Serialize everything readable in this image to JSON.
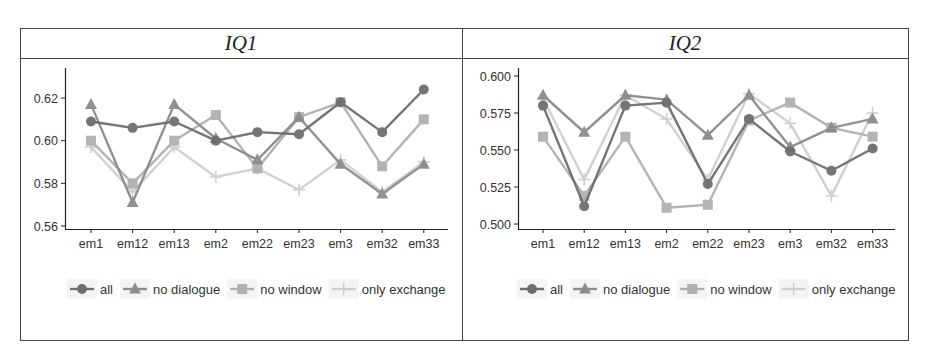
{
  "chart_data": [
    {
      "type": "line",
      "title": "IQ1",
      "xlabel": "",
      "ylabel": "",
      "categories": [
        "em1",
        "em12",
        "em13",
        "em2",
        "em22",
        "em23",
        "em3",
        "em32",
        "em33"
      ],
      "ylim": [
        0.558,
        0.633
      ],
      "yticks": [
        0.56,
        0.58,
        0.6,
        0.62
      ],
      "ytick_labels": [
        "0.56",
        "0.58",
        "0.60",
        "0.62"
      ],
      "grid": false,
      "legend_position": "bottom",
      "series": [
        {
          "name": "all",
          "marker": "circle",
          "color": "#6e6e6e",
          "values": [
            0.609,
            0.606,
            0.609,
            0.6,
            0.604,
            0.603,
            0.618,
            0.604,
            0.624
          ]
        },
        {
          "name": "no dialogue",
          "marker": "triangle",
          "color": "#8c8c8c",
          "values": [
            0.617,
            0.571,
            0.617,
            0.601,
            0.591,
            0.611,
            0.589,
            0.575,
            0.589
          ]
        },
        {
          "name": "no window",
          "marker": "square",
          "color": "#b0b0b0",
          "values": [
            0.6,
            0.58,
            0.6,
            0.612,
            0.587,
            0.611,
            0.618,
            0.588,
            0.61
          ]
        },
        {
          "name": "only exchange",
          "marker": "plus",
          "color": "#cfcfcf",
          "values": [
            0.597,
            0.576,
            0.597,
            0.583,
            0.587,
            0.577,
            0.591,
            0.576,
            0.59
          ]
        }
      ]
    },
    {
      "type": "line",
      "title": "IQ2",
      "xlabel": "",
      "ylabel": "",
      "categories": [
        "em1",
        "em12",
        "em13",
        "em2",
        "em22",
        "em23",
        "em3",
        "em32",
        "em33"
      ],
      "ylim": [
        0.495,
        0.605
      ],
      "yticks": [
        0.5,
        0.525,
        0.55,
        0.575,
        0.6
      ],
      "ytick_labels": [
        "0.500",
        "0.525",
        "0.550",
        "0.575",
        "0.600"
      ],
      "grid": false,
      "legend_position": "bottom",
      "series": [
        {
          "name": "all",
          "marker": "circle",
          "color": "#6e6e6e",
          "values": [
            0.58,
            0.512,
            0.58,
            0.582,
            0.527,
            0.571,
            0.549,
            0.536,
            0.551
          ]
        },
        {
          "name": "no dialogue",
          "marker": "triangle",
          "color": "#8c8c8c",
          "values": [
            0.587,
            0.562,
            0.587,
            0.584,
            0.56,
            0.587,
            0.552,
            0.565,
            0.571
          ]
        },
        {
          "name": "no window",
          "marker": "square",
          "color": "#b0b0b0",
          "values": [
            0.559,
            0.519,
            0.559,
            0.511,
            0.513,
            0.57,
            0.582,
            0.565,
            0.559
          ]
        },
        {
          "name": "only exchange",
          "marker": "plus",
          "color": "#cfcfcf",
          "values": [
            0.585,
            0.53,
            0.587,
            0.571,
            0.53,
            0.588,
            0.568,
            0.519,
            0.575
          ]
        }
      ]
    }
  ],
  "panels": [
    {
      "title": "IQ1"
    },
    {
      "title": "IQ2"
    }
  ],
  "legend": {
    "items": [
      {
        "label": "all"
      },
      {
        "label": "no dialogue"
      },
      {
        "label": "no window"
      },
      {
        "label": "only exchange"
      }
    ]
  }
}
